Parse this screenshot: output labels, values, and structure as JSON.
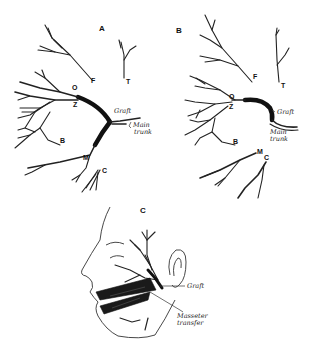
{
  "figure": {
    "panels": [
      {
        "id": "A",
        "label": "A",
        "branch_labels": {
          "F": "F",
          "T": "T",
          "O": "O",
          "Z": "Z",
          "B": "B",
          "M": "M",
          "C": "C"
        },
        "annotations": {
          "graft": "Graft",
          "main_trunk_line1": "Main",
          "main_trunk_line2": "trunk"
        }
      },
      {
        "id": "B",
        "label": "B",
        "branch_labels": {
          "F": "F",
          "T": "T",
          "O": "O",
          "Z": "Z",
          "B": "B",
          "M": "M",
          "C": "C"
        },
        "annotations": {
          "graft": "Graft",
          "main_trunk_line1": "Main",
          "main_trunk_line2": "trunk"
        }
      },
      {
        "id": "C",
        "label": "C",
        "annotations": {
          "graft": "Graft",
          "masseter_line1": "Masseter",
          "masseter_line2": "transfer"
        }
      }
    ]
  }
}
